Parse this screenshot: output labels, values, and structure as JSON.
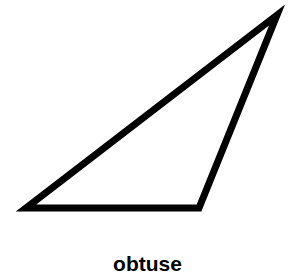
{
  "diagram": {
    "shape": "triangle",
    "type": "obtuse",
    "vertices": [
      [
        26,
        208
      ],
      [
        199,
        208
      ],
      [
        277,
        15
      ]
    ],
    "stroke_color": "#000000",
    "fill_color": "#ffffff",
    "stroke_width": 7
  },
  "caption": {
    "label": "obtuse"
  }
}
